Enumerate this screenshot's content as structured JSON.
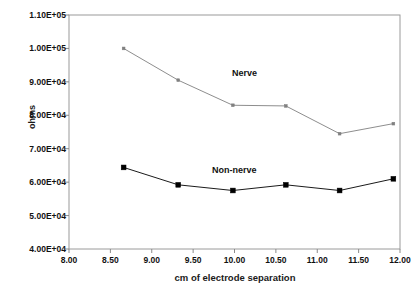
{
  "chart_data": {
    "type": "line",
    "title": "",
    "xlabel": "cm of electrode separation",
    "ylabel": "ohms",
    "xlim": [
      8.0,
      12.0
    ],
    "ylim": [
      40000,
      110000
    ],
    "xticks": [
      "8.00",
      "8.50",
      "9.00",
      "9.50",
      "10.00",
      "10.50",
      "11.00",
      "11.50",
      "12.00"
    ],
    "xtick_values": [
      8.0,
      8.5,
      9.0,
      9.5,
      10.0,
      10.5,
      11.0,
      11.5,
      12.0
    ],
    "yticks": [
      "4.00E+04",
      "5.00E+04",
      "6.00E+04",
      "7.00E+04",
      "8.00E+04",
      "9.00E+04",
      "1.00E+05",
      "1.10E+05"
    ],
    "ytick_values": [
      40000,
      50000,
      60000,
      70000,
      80000,
      90000,
      100000,
      110000
    ],
    "grid": false,
    "legend_position": "inline-annotation",
    "series": [
      {
        "name": "Nerve",
        "color": "#808080",
        "marker": "square-small",
        "x": [
          8.66,
          9.32,
          9.98,
          10.62,
          11.27,
          11.92
        ],
        "values": [
          100000,
          90500,
          83000,
          82800,
          74500,
          77500
        ]
      },
      {
        "name": "Non-nerve",
        "color": "#000000",
        "marker": "square",
        "x": [
          8.66,
          9.32,
          9.98,
          10.62,
          11.27,
          11.92
        ],
        "values": [
          64400,
          59200,
          57500,
          59200,
          57500,
          61000
        ]
      }
    ],
    "annotations": [
      {
        "text": "Nerve",
        "x": 10.6,
        "y": 87000
      },
      {
        "text": "Non-nerve",
        "x": 10.1,
        "y": 62500
      }
    ]
  },
  "axes": {
    "y_title": "ohms",
    "x_title": "cm of electrode separation"
  }
}
